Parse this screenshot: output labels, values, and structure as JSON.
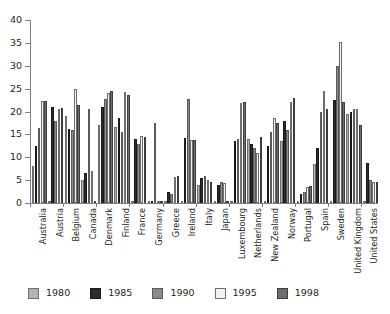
{
  "chart_data": {
    "type": "bar",
    "title": "",
    "xlabel": "",
    "ylabel": "",
    "ylim": [
      0,
      40
    ],
    "yticks": [
      0,
      5,
      10,
      15,
      20,
      25,
      30,
      35,
      40
    ],
    "grid": false,
    "legend_position": "bottom",
    "categories": [
      "Australia",
      "Austria",
      "Belgium",
      "Canada",
      "Denmark",
      "Finland",
      "France",
      "Germany",
      "Greece",
      "Ireland",
      "Italy",
      "Japan",
      "Luxembourg",
      "Netherlands",
      "New Zealand",
      "Norway",
      "Portugal",
      "Spain",
      "Sweden",
      "United Kingdom",
      "United States"
    ],
    "series": [
      {
        "name": "1980",
        "color": "#b3b3b3",
        "values": [
          8.0,
          0.0,
          19.0,
          5.0,
          17.0,
          16.7,
          0.0,
          0.0,
          0.0,
          0.0,
          4.0,
          0.0,
          0.0,
          14.0,
          0.0,
          13.5,
          0.0,
          8.5,
          0.0,
          19.5,
          0.0
        ]
      },
      {
        "name": "1985",
        "color": "#2b2b2b",
        "values": [
          12.4,
          21.0,
          16.2,
          6.5,
          21.0,
          18.5,
          14.0,
          0.0,
          2.5,
          14.3,
          5.5,
          4.0,
          13.5,
          12.8,
          12.5,
          18.0,
          2.0,
          12.0,
          22.5,
          20.0,
          8.8
        ]
      },
      {
        "name": "1990",
        "color": "#8a8a8a",
        "values": [
          16.3,
          18.0,
          16.0,
          20.5,
          22.8,
          15.5,
          13.0,
          17.5,
          2.0,
          22.7,
          6.0,
          4.5,
          14.0,
          12.0,
          15.5,
          16.0,
          2.5,
          20.0,
          30.0,
          20.5,
          5.0
        ]
      },
      {
        "name": "1995",
        "color": "#f2f2f2",
        "values": [
          22.3,
          20.5,
          25.0,
          7.0,
          24.0,
          24.2,
          14.7,
          0.0,
          5.7,
          13.8,
          5.0,
          4.3,
          21.8,
          11.0,
          18.5,
          22.0,
          3.5,
          24.5,
          35.3,
          20.5,
          4.7
        ]
      },
      {
        "name": "1998",
        "color": "#6e6e6e",
        "values": [
          22.4,
          20.7,
          21.5,
          0.0,
          24.5,
          23.6,
          14.5,
          0.0,
          5.8,
          13.7,
          4.5,
          0.0,
          22.0,
          14.5,
          17.5,
          23.0,
          3.8,
          20.5,
          22.0,
          17.0,
          4.5
        ]
      }
    ]
  },
  "legend": {
    "items": [
      {
        "label": "1980"
      },
      {
        "label": "1985"
      },
      {
        "label": "1990"
      },
      {
        "label": "1995"
      },
      {
        "label": "1998"
      }
    ]
  }
}
